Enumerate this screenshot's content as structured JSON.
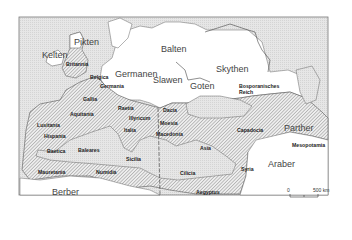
{
  "map": {
    "peoples": [
      {
        "label": "Pikten",
        "x": 74,
        "y": 38
      },
      {
        "label": "Kelten",
        "x": 42,
        "y": 51
      },
      {
        "label": "Balten",
        "x": 161,
        "y": 45
      },
      {
        "label": "Germanen",
        "x": 115,
        "y": 70
      },
      {
        "label": "Slawen",
        "x": 153,
        "y": 76
      },
      {
        "label": "Skythen",
        "x": 216,
        "y": 65
      },
      {
        "label": "Goten",
        "x": 190,
        "y": 82
      },
      {
        "label": "Parther",
        "x": 284,
        "y": 124
      },
      {
        "label": "Araber",
        "x": 268,
        "y": 160
      },
      {
        "label": "Berber",
        "x": 52,
        "y": 188
      }
    ],
    "provinces": [
      {
        "label": "Britannia",
        "x": 66,
        "y": 62
      },
      {
        "label": "Belgica",
        "x": 90,
        "y": 75
      },
      {
        "label": "Germania",
        "x": 100,
        "y": 84
      },
      {
        "label": "Gallia",
        "x": 83,
        "y": 97
      },
      {
        "label": "Aquitania",
        "x": 70,
        "y": 112
      },
      {
        "label": "Raetia",
        "x": 118,
        "y": 106
      },
      {
        "label": "Illyricum",
        "x": 129,
        "y": 116
      },
      {
        "label": "Dacia",
        "x": 163,
        "y": 108
      },
      {
        "label": "Moesia",
        "x": 160,
        "y": 121
      },
      {
        "label": "Bosporanisches",
        "x": 239,
        "y": 84
      },
      {
        "label": "Reich",
        "x": 239,
        "y": 90
      },
      {
        "label": "Lusitania",
        "x": 37,
        "y": 123
      },
      {
        "label": "Hispania",
        "x": 44,
        "y": 134
      },
      {
        "label": "Italia",
        "x": 124,
        "y": 128
      },
      {
        "label": "Macedonia",
        "x": 156,
        "y": 132
      },
      {
        "label": "Capadocia",
        "x": 237,
        "y": 128
      },
      {
        "label": "Mesopotamia",
        "x": 292,
        "y": 143
      },
      {
        "label": "Baetica",
        "x": 47,
        "y": 149
      },
      {
        "label": "Baleares",
        "x": 78,
        "y": 148
      },
      {
        "label": "Asia",
        "x": 200,
        "y": 146
      },
      {
        "label": "Sicilia",
        "x": 126,
        "y": 157
      },
      {
        "label": "Cilicia",
        "x": 180,
        "y": 171
      },
      {
        "label": "Syria",
        "x": 241,
        "y": 167
      },
      {
        "label": "Mauretania",
        "x": 38,
        "y": 170
      },
      {
        "label": "Numidia",
        "x": 96,
        "y": 170
      },
      {
        "label": "Aegyptus",
        "x": 196,
        "y": 190
      }
    ],
    "scale_bar": {
      "start_label": "0",
      "end_label": "500 km"
    }
  }
}
